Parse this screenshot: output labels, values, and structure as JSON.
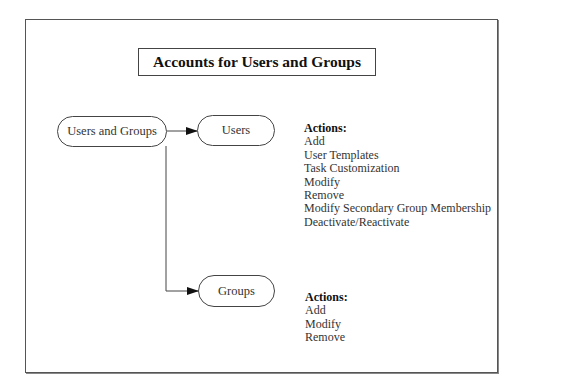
{
  "diagram": {
    "title": "Accounts for Users and Groups",
    "nodes": {
      "root": "Users and Groups",
      "users": "Users",
      "groups": "Groups"
    },
    "users_actions": {
      "header": "Actions:",
      "items": [
        "Add",
        "User Templates",
        "Task Customization",
        "Modify",
        "Remove",
        "Modify Secondary Group Membership",
        "Deactivate/Reactivate"
      ]
    },
    "groups_actions": {
      "header": "Actions:",
      "items": [
        "Add",
        "Modify",
        "Remove"
      ]
    },
    "edges": [
      {
        "from": "root",
        "to": "users"
      },
      {
        "from": "root",
        "to": "groups"
      }
    ]
  }
}
